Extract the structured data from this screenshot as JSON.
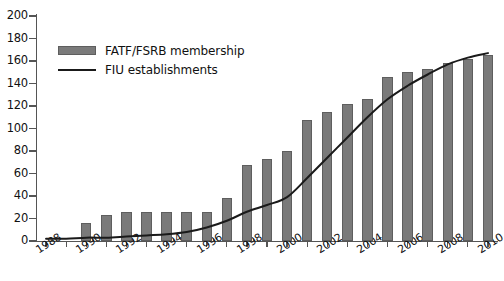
{
  "chart_data": {
    "type": "bar",
    "title": "",
    "subtitle": "",
    "xlabel": "",
    "ylabel": "",
    "ylim": [
      0,
      200
    ],
    "ytick_step": 20,
    "ytick_labels": [
      "0",
      "20",
      "40",
      "60",
      "80",
      "100",
      "120",
      "140",
      "160",
      "180",
      "200"
    ],
    "grid": false,
    "legend_position": "top-left",
    "xlim": [
      1988,
      2010
    ],
    "x": [
      1988,
      1989,
      1990,
      1991,
      1992,
      1993,
      1994,
      1995,
      1996,
      1997,
      1998,
      1999,
      2000,
      2001,
      2002,
      2003,
      2004,
      2005,
      2006,
      2007,
      2008,
      2009,
      2010
    ],
    "xtick_labels": [
      "1988",
      "1990",
      "1992",
      "1994",
      "1996",
      "1998",
      "2000",
      "2002",
      "2004",
      "2006",
      "2008",
      "2010"
    ],
    "xtick_label_years": [
      1988,
      1990,
      1992,
      1994,
      1996,
      1998,
      2000,
      2002,
      2004,
      2006,
      2008,
      2010
    ],
    "series": [
      {
        "name": "FATF/FSRB membership",
        "type": "bar",
        "color": "#7a7a7a",
        "values": [
          0,
          0,
          16,
          23,
          26,
          26,
          26,
          26,
          26,
          38,
          68,
          73,
          80,
          108,
          115,
          122,
          126,
          146,
          150,
          153,
          158,
          162,
          165
        ]
      },
      {
        "name": "FIU establishments",
        "type": "line",
        "color": "#1a1a1a",
        "values": [
          2,
          2,
          3,
          3,
          4,
          5,
          6,
          8,
          12,
          18,
          26,
          32,
          39,
          56,
          74,
          92,
          110,
          126,
          138,
          148,
          157,
          163,
          167
        ]
      }
    ]
  },
  "legend": {
    "items": [
      {
        "label": "FATF/FSRB membership",
        "marker": "bar-swatch"
      },
      {
        "label": "FIU establishments",
        "marker": "line-swatch"
      }
    ]
  }
}
